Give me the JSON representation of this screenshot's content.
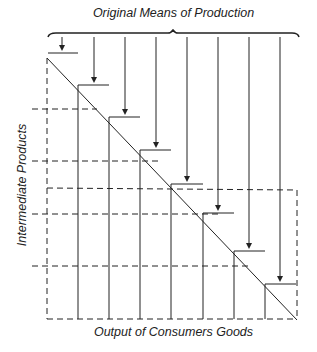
{
  "diagram": {
    "title_top": "Original Means of Production",
    "label_left": "Intermediate Products",
    "label_bottom": "Output of Consumers Goods",
    "line_color": "#222222",
    "stages": [
      {
        "x": 62,
        "bar_y": 53,
        "x0": 48,
        "x1": 78
      },
      {
        "x": 94,
        "bar_y": 85,
        "x0": 78,
        "x1": 109
      },
      {
        "x": 125,
        "bar_y": 117,
        "x0": 109,
        "x1": 140
      },
      {
        "x": 156,
        "bar_y": 150,
        "x0": 140,
        "x1": 171
      },
      {
        "x": 187,
        "bar_y": 184,
        "x0": 171,
        "x1": 203
      },
      {
        "x": 218,
        "bar_y": 213,
        "x0": 203,
        "x1": 234
      },
      {
        "x": 249,
        "bar_y": 251,
        "x0": 234,
        "x1": 265
      },
      {
        "x": 280,
        "bar_y": 284,
        "x0": 265,
        "x1": 296
      }
    ]
  }
}
